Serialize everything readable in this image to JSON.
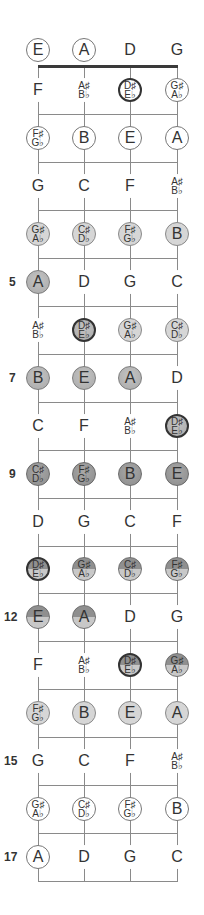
{
  "diagram": {
    "title": "",
    "strings": [
      "E",
      "A",
      "D",
      "G"
    ],
    "fret_labels": [
      {
        "fret": 5,
        "label": "5"
      },
      {
        "fret": 7,
        "label": "7"
      },
      {
        "fret": 9,
        "label": "9"
      },
      {
        "fret": 12,
        "label": "12"
      },
      {
        "fret": 15,
        "label": "15"
      },
      {
        "fret": 17,
        "label": "17"
      }
    ],
    "colors": {
      "line": "#8a8a8a",
      "nut": "#3a3a3a",
      "light": "#d6d6d6",
      "medium": "#b5b5b5",
      "dark": "#999999"
    },
    "rows": [
      {
        "fret": 0,
        "notes": [
          {
            "l1": "E",
            "style": "outline"
          },
          {
            "l1": "A",
            "style": "outline"
          },
          {
            "l1": "D",
            "style": "plain"
          },
          {
            "l1": "G",
            "style": "plain"
          }
        ]
      },
      {
        "fret": 1,
        "notes": [
          {
            "l1": "F",
            "style": "plain"
          },
          {
            "l1": "A♯",
            "l2": "B♭",
            "style": "plain"
          },
          {
            "l1": "D♯",
            "l2": "E♭",
            "style": "outline",
            "ring": true
          },
          {
            "l1": "G♯",
            "l2": "A♭",
            "style": "outline"
          }
        ]
      },
      {
        "fret": 2,
        "notes": [
          {
            "l1": "F♯",
            "l2": "G♭",
            "style": "outline"
          },
          {
            "l1": "B",
            "style": "outline"
          },
          {
            "l1": "E",
            "style": "outline"
          },
          {
            "l1": "A",
            "style": "outline"
          }
        ]
      },
      {
        "fret": 3,
        "notes": [
          {
            "l1": "G",
            "style": "plain"
          },
          {
            "l1": "C",
            "style": "plain"
          },
          {
            "l1": "F",
            "style": "plain"
          },
          {
            "l1": "A♯",
            "l2": "B♭",
            "style": "plain"
          }
        ]
      },
      {
        "fret": 4,
        "notes": [
          {
            "l1": "G♯",
            "l2": "A♭",
            "style": "light"
          },
          {
            "l1": "C♯",
            "l2": "D♭",
            "style": "light"
          },
          {
            "l1": "F♯",
            "l2": "G♭",
            "style": "light"
          },
          {
            "l1": "B",
            "style": "light"
          }
        ]
      },
      {
        "fret": 5,
        "notes": [
          {
            "l1": "A",
            "style": "medium"
          },
          {
            "l1": "D",
            "style": "plain"
          },
          {
            "l1": "G",
            "style": "plain"
          },
          {
            "l1": "C",
            "style": "plain"
          }
        ]
      },
      {
        "fret": 6,
        "notes": [
          {
            "l1": "A♯",
            "l2": "B♭",
            "style": "plain"
          },
          {
            "l1": "D♯",
            "l2": "E♭",
            "style": "medium",
            "ring": true
          },
          {
            "l1": "G♯",
            "l2": "A♭",
            "style": "light"
          },
          {
            "l1": "C♯",
            "l2": "D♭",
            "style": "light"
          }
        ]
      },
      {
        "fret": 7,
        "notes": [
          {
            "l1": "B",
            "style": "medium"
          },
          {
            "l1": "E",
            "style": "medium"
          },
          {
            "l1": "A",
            "style": "medium"
          },
          {
            "l1": "D",
            "style": "plain"
          }
        ]
      },
      {
        "fret": 8,
        "notes": [
          {
            "l1": "C",
            "style": "plain"
          },
          {
            "l1": "F",
            "style": "plain"
          },
          {
            "l1": "A♯",
            "l2": "B♭",
            "style": "plain"
          },
          {
            "l1": "D♯",
            "l2": "E♭",
            "style": "medium",
            "ring": true
          }
        ]
      },
      {
        "fret": 9,
        "notes": [
          {
            "l1": "C♯",
            "l2": "D♭",
            "style": "dark"
          },
          {
            "l1": "F♯",
            "l2": "G♭",
            "style": "dark"
          },
          {
            "l1": "B",
            "style": "dark"
          },
          {
            "l1": "E",
            "style": "dark"
          }
        ]
      },
      {
        "fret": 10,
        "notes": [
          {
            "l1": "D",
            "style": "plain"
          },
          {
            "l1": "G",
            "style": "plain"
          },
          {
            "l1": "C",
            "style": "plain"
          },
          {
            "l1": "F",
            "style": "plain"
          }
        ]
      },
      {
        "fret": 11,
        "notes": [
          {
            "l1": "D♯",
            "l2": "E♭",
            "style": "split",
            "ring": true
          },
          {
            "l1": "G♯",
            "l2": "A♭",
            "style": "split"
          },
          {
            "l1": "C♯",
            "l2": "D♭",
            "style": "split"
          },
          {
            "l1": "F♯",
            "l2": "G♭",
            "style": "split"
          }
        ]
      },
      {
        "fret": 12,
        "notes": [
          {
            "l1": "E",
            "style": "split"
          },
          {
            "l1": "A",
            "style": "split"
          },
          {
            "l1": "D",
            "style": "plain"
          },
          {
            "l1": "G",
            "style": "plain"
          }
        ]
      },
      {
        "fret": 13,
        "notes": [
          {
            "l1": "F",
            "style": "plain"
          },
          {
            "l1": "A♯",
            "l2": "B♭",
            "style": "plain"
          },
          {
            "l1": "D♯",
            "l2": "E♭",
            "style": "split",
            "ring": true
          },
          {
            "l1": "G♯",
            "l2": "A♭",
            "style": "split"
          }
        ]
      },
      {
        "fret": 14,
        "notes": [
          {
            "l1": "F♯",
            "l2": "G♭",
            "style": "light"
          },
          {
            "l1": "B",
            "style": "light"
          },
          {
            "l1": "E",
            "style": "light"
          },
          {
            "l1": "A",
            "style": "light"
          }
        ]
      },
      {
        "fret": 15,
        "notes": [
          {
            "l1": "G",
            "style": "plain"
          },
          {
            "l1": "C",
            "style": "plain"
          },
          {
            "l1": "F",
            "style": "plain"
          },
          {
            "l1": "A♯",
            "l2": "B♭",
            "style": "plain"
          }
        ]
      },
      {
        "fret": 16,
        "notes": [
          {
            "l1": "G♯",
            "l2": "A♭",
            "style": "outline"
          },
          {
            "l1": "C♯",
            "l2": "D♭",
            "style": "outline"
          },
          {
            "l1": "F♯",
            "l2": "G♭",
            "style": "outline"
          },
          {
            "l1": "B",
            "style": "outline"
          }
        ]
      },
      {
        "fret": 17,
        "notes": [
          {
            "l1": "A",
            "style": "outline"
          },
          {
            "l1": "D",
            "style": "plain"
          },
          {
            "l1": "G",
            "style": "plain"
          },
          {
            "l1": "C",
            "style": "plain"
          }
        ]
      }
    ]
  }
}
